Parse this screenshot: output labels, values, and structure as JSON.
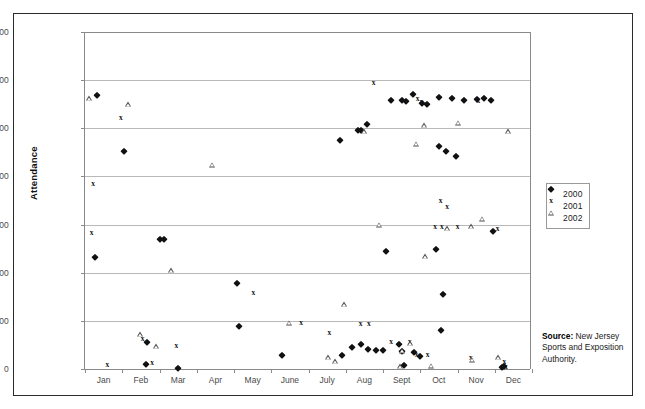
{
  "chart_data": {
    "type": "scatter",
    "title": "",
    "xlabel": "",
    "ylabel": "Attendance",
    "ylim": [
      0,
      70000
    ],
    "ytick_values": [
      0,
      10000,
      20000,
      30000,
      40000,
      50000,
      60000,
      70000
    ],
    "ytick_labels": [
      "0",
      "10,000",
      "20,000",
      "30,000",
      "40,000",
      "50,000",
      "60,000",
      "70,000"
    ],
    "xlim": [
      0,
      12
    ],
    "categories": [
      "Jan",
      "Feb",
      "Mar",
      "Apr",
      "May",
      "June",
      "July",
      "Aug",
      "Sept",
      "Oct",
      "Nov",
      "Dec"
    ],
    "grid": "horizontal",
    "legend_position": "right",
    "series": [
      {
        "name": "2000",
        "marker": "diamond",
        "color": "#111111",
        "points": [
          {
            "x": 0.32,
            "y": 57000
          },
          {
            "x": 0.28,
            "y": 23300
          },
          {
            "x": 1.05,
            "y": 45200
          },
          {
            "x": 2.02,
            "y": 26900
          },
          {
            "x": 2.12,
            "y": 26900
          },
          {
            "x": 2.49,
            "y": 300
          },
          {
            "x": 1.63,
            "y": 1100
          },
          {
            "x": 1.66,
            "y": 5600
          },
          {
            "x": 4.08,
            "y": 17900
          },
          {
            "x": 4.13,
            "y": 8900
          },
          {
            "x": 5.3,
            "y": 3000
          },
          {
            "x": 6.84,
            "y": 47500
          },
          {
            "x": 7.32,
            "y": 49600
          },
          {
            "x": 7.4,
            "y": 49600
          },
          {
            "x": 7.57,
            "y": 50900
          },
          {
            "x": 6.9,
            "y": 3000
          },
          {
            "x": 7.18,
            "y": 4600
          },
          {
            "x": 7.42,
            "y": 5200
          },
          {
            "x": 7.6,
            "y": 4100
          },
          {
            "x": 7.8,
            "y": 4000
          },
          {
            "x": 8.0,
            "y": 4000
          },
          {
            "x": 8.08,
            "y": 24600
          },
          {
            "x": 8.22,
            "y": 55800
          },
          {
            "x": 8.52,
            "y": 55800
          },
          {
            "x": 8.62,
            "y": 55700
          },
          {
            "x": 8.8,
            "y": 57200
          },
          {
            "x": 9.04,
            "y": 55200
          },
          {
            "x": 9.18,
            "y": 55100
          },
          {
            "x": 8.44,
            "y": 5100
          },
          {
            "x": 8.5,
            "y": 3800
          },
          {
            "x": 8.57,
            "y": 900
          },
          {
            "x": 8.82,
            "y": 3600
          },
          {
            "x": 9.0,
            "y": 2700
          },
          {
            "x": 9.42,
            "y": 25000
          },
          {
            "x": 9.5,
            "y": 46400
          },
          {
            "x": 9.7,
            "y": 45200
          },
          {
            "x": 9.95,
            "y": 44200
          },
          {
            "x": 9.62,
            "y": 15500
          },
          {
            "x": 9.55,
            "y": 8000
          },
          {
            "x": 9.49,
            "y": 56400
          },
          {
            "x": 9.86,
            "y": 56200
          },
          {
            "x": 10.18,
            "y": 55900
          },
          {
            "x": 10.52,
            "y": 56000
          },
          {
            "x": 10.7,
            "y": 56200
          },
          {
            "x": 10.9,
            "y": 55900
          },
          {
            "x": 10.96,
            "y": 28600
          },
          {
            "x": 11.2,
            "y": 500
          },
          {
            "x": 11.26,
            "y": 700
          }
        ]
      },
      {
        "name": "2001",
        "marker": "x",
        "color": "#111111",
        "points": [
          {
            "x": 0.22,
            "y": 38400
          },
          {
            "x": 0.18,
            "y": 28300
          },
          {
            "x": 0.96,
            "y": 52200
          },
          {
            "x": 0.6,
            "y": 900
          },
          {
            "x": 1.55,
            "y": 6200
          },
          {
            "x": 1.8,
            "y": 1200
          },
          {
            "x": 2.45,
            "y": 4700
          },
          {
            "x": 4.52,
            "y": 15700
          },
          {
            "x": 5.8,
            "y": 9600
          },
          {
            "x": 6.56,
            "y": 7500
          },
          {
            "x": 7.4,
            "y": 9400
          },
          {
            "x": 7.62,
            "y": 9300
          },
          {
            "x": 7.75,
            "y": 59500
          },
          {
            "x": 8.22,
            "y": 5600
          },
          {
            "x": 8.93,
            "y": 56000
          },
          {
            "x": 9.04,
            "y": 55400
          },
          {
            "x": 8.72,
            "y": 5700
          },
          {
            "x": 8.9,
            "y": 3000
          },
          {
            "x": 9.55,
            "y": 34900
          },
          {
            "x": 9.72,
            "y": 33600
          },
          {
            "x": 9.4,
            "y": 29500
          },
          {
            "x": 9.58,
            "y": 29500
          },
          {
            "x": 10.0,
            "y": 29400
          },
          {
            "x": 10.36,
            "y": 2300
          },
          {
            "x": 10.56,
            "y": 55700
          },
          {
            "x": 11.08,
            "y": 29000
          },
          {
            "x": 11.26,
            "y": 1500
          },
          {
            "x": 11.3,
            "y": 500
          },
          {
            "x": 9.2,
            "y": 2900
          }
        ]
      },
      {
        "name": "2002",
        "marker": "triangle",
        "color": "#4a4a4a",
        "points": [
          {
            "x": 0.12,
            "y": 56200
          },
          {
            "x": 1.16,
            "y": 55000
          },
          {
            "x": 1.48,
            "y": 7200
          },
          {
            "x": 1.9,
            "y": 4700
          },
          {
            "x": 2.3,
            "y": 20500
          },
          {
            "x": 3.4,
            "y": 42400
          },
          {
            "x": 5.48,
            "y": 9600
          },
          {
            "x": 6.52,
            "y": 2500
          },
          {
            "x": 6.7,
            "y": 1600
          },
          {
            "x": 6.95,
            "y": 13500
          },
          {
            "x": 7.5,
            "y": 49400
          },
          {
            "x": 7.88,
            "y": 30000
          },
          {
            "x": 8.5,
            "y": 3800
          },
          {
            "x": 8.46,
            "y": 600
          },
          {
            "x": 8.72,
            "y": 5400
          },
          {
            "x": 8.88,
            "y": 46800
          },
          {
            "x": 9.1,
            "y": 50600
          },
          {
            "x": 9.3,
            "y": 700
          },
          {
            "x": 9.14,
            "y": 23400
          },
          {
            "x": 9.72,
            "y": 29300
          },
          {
            "x": 10.0,
            "y": 51200
          },
          {
            "x": 10.36,
            "y": 29600
          },
          {
            "x": 10.4,
            "y": 1900
          },
          {
            "x": 10.66,
            "y": 31200
          },
          {
            "x": 11.1,
            "y": 2400
          },
          {
            "x": 11.36,
            "y": 49400
          }
        ]
      }
    ]
  },
  "legend": {
    "items": [
      {
        "label": "2000",
        "marker": "diamond"
      },
      {
        "label": "2001",
        "marker": "x"
      },
      {
        "label": "2002",
        "marker": "triangle"
      }
    ]
  },
  "source_note": {
    "label": "Source:",
    "text": " New Jersey Sports and Exposition Authority."
  }
}
